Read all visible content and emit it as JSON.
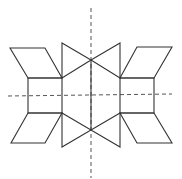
{
  "figure": {
    "stroke_color": "#333333",
    "axis_color": "#555555",
    "background": "#ffffff",
    "symmetry_axes": {
      "vertical": {
        "x1": 91,
        "y1": 8,
        "x2": 91,
        "y2": 178
      },
      "horizontal": {
        "x1": 8,
        "y1": 96,
        "x2": 172,
        "y2": 94
      }
    },
    "shapes": {
      "left_square": "28,78 62,78 62,113 28,113",
      "right_square": "120,78 154,78 154,113 120,113",
      "left_top_parallelogram": "10,48 45,48 62,78 28,78",
      "left_bottom_parallelogram": "28,113 62,113 45,143 11,143",
      "right_top_parallelogram": "137,47 172,47 154,78 120,78",
      "right_bottom_parallelogram": "120,113 154,113 172,143 137,143",
      "left_top_triangle": "62,43 62,78 91,60",
      "left_bottom_triangle": "62,113 62,147 91,130",
      "right_top_triangle": "120,43 120,78 91,60",
      "right_bottom_triangle": "120,113 120,147 91,130"
    },
    "center_segment": {
      "x1": 91,
      "y1": 60,
      "x2": 91,
      "y2": 130
    }
  }
}
